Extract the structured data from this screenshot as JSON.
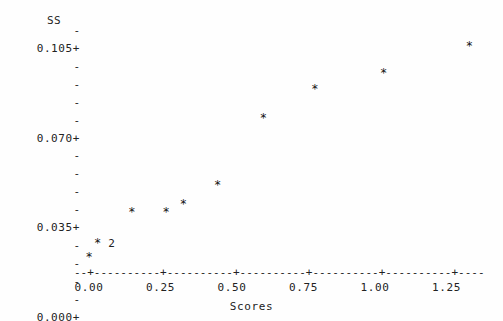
{
  "chart_data": {
    "type": "scatter",
    "title": "",
    "xlabel": "Scores",
    "ylabel": "SS",
    "xlim": [
      -0.02,
      1.42
    ],
    "ylim": [
      0.0,
      0.1085
    ],
    "grid": false,
    "legend": null,
    "style": "character-plot",
    "point_glyph": "*",
    "xticks": [
      "0.00",
      "0.25",
      "0.50",
      "0.75",
      "1.00",
      "1.25"
    ],
    "xtick_values": [
      0.0,
      0.25,
      0.5,
      0.75,
      1.0,
      1.25
    ],
    "yticks": [
      "0.000+",
      "0.035+",
      "0.070+",
      "0.105+"
    ],
    "ytick_values": [
      0.0,
      0.035,
      0.07,
      0.105
    ],
    "y_minor_glyph": "-",
    "y_minor_per_interval": 4,
    "x_axis_glyphs": {
      "line": "-",
      "tick": "+"
    },
    "points": [
      {
        "x": 0.0,
        "y": 0.001,
        "count": 1,
        "count_label": ""
      },
      {
        "x": 0.03,
        "y": 0.008,
        "count": 2,
        "count_label": "2"
      },
      {
        "x": 0.15,
        "y": 0.023,
        "count": 1,
        "count_label": ""
      },
      {
        "x": 0.27,
        "y": 0.023,
        "count": 1,
        "count_label": ""
      },
      {
        "x": 0.33,
        "y": 0.027,
        "count": 1,
        "count_label": ""
      },
      {
        "x": 0.45,
        "y": 0.036,
        "count": 1,
        "count_label": ""
      },
      {
        "x": 0.61,
        "y": 0.069,
        "count": 1,
        "count_label": ""
      },
      {
        "x": 0.79,
        "y": 0.083,
        "count": 1,
        "count_label": ""
      },
      {
        "x": 1.03,
        "y": 0.091,
        "count": 1,
        "count_label": ""
      },
      {
        "x": 1.33,
        "y": 0.104,
        "count": 1,
        "count_label": ""
      }
    ]
  },
  "axes": {
    "y_title": "SS",
    "x_title": "Scores",
    "x_axis_line": "--+----------+----------+----------+----------+----------+----",
    "y_rows": [
      {
        "label": "SS",
        "kind": "title"
      },
      {
        "label": "-",
        "kind": "minor"
      },
      {
        "label": "0.105+",
        "kind": "major"
      },
      {
        "label": "-",
        "kind": "minor"
      },
      {
        "label": "-",
        "kind": "minor"
      },
      {
        "label": "-",
        "kind": "minor"
      },
      {
        "label": "-",
        "kind": "minor"
      },
      {
        "label": "0.070+",
        "kind": "major"
      },
      {
        "label": "-",
        "kind": "minor"
      },
      {
        "label": "-",
        "kind": "minor"
      },
      {
        "label": "-",
        "kind": "minor"
      },
      {
        "label": "-",
        "kind": "minor"
      },
      {
        "label": "0.035+",
        "kind": "major"
      },
      {
        "label": "-",
        "kind": "minor"
      },
      {
        "label": "-",
        "kind": "minor"
      },
      {
        "label": "-",
        "kind": "minor"
      },
      {
        "label": "-",
        "kind": "minor"
      },
      {
        "label": "0.000+",
        "kind": "major"
      }
    ]
  },
  "colors": {
    "background": "#fefefe",
    "text": "#222222",
    "point": "#111111"
  }
}
